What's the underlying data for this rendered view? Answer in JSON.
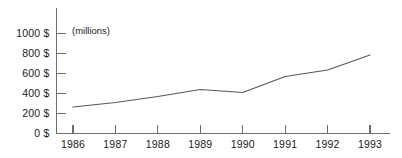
{
  "chart_data": {
    "type": "line",
    "title": "",
    "subtitle": "",
    "unit_note": "(millions)",
    "xlabel": "",
    "ylabel": "",
    "categories": [
      "1986",
      "1987",
      "1988",
      "1989",
      "1990",
      "1991",
      "1992",
      "1993"
    ],
    "x": [
      1986,
      1987,
      1988,
      1989,
      1990,
      1991,
      1992,
      1993
    ],
    "values": [
      265,
      310,
      370,
      440,
      410,
      570,
      635,
      785
    ],
    "series": [
      {
        "name": "",
        "values": [
          265,
          310,
          370,
          440,
          410,
          570,
          635,
          785
        ],
        "color": "#58585a"
      }
    ],
    "ylim": [
      0,
      1000
    ],
    "yticks": [
      0,
      200,
      400,
      600,
      800,
      1000
    ],
    "ytick_labels": [
      "0 $",
      "200 $",
      "400 $",
      "600 $",
      "800 $",
      "1000 $"
    ],
    "xtick_labels": [
      "1986",
      "1987",
      "1988",
      "1989",
      "1990",
      "1991",
      "1992",
      "1993"
    ],
    "grid": false,
    "legend": false,
    "legend_position": "none",
    "axis_color": "#6e6e6e",
    "line_color": "#58585a",
    "text_color": "#1a1a1a",
    "background": "#ffffff"
  },
  "axes": {
    "y_labels": [
      {
        "value": 1000,
        "text": "1000 $"
      },
      {
        "value": 800,
        "text": "800 $"
      },
      {
        "value": 600,
        "text": "600 $"
      },
      {
        "value": 400,
        "text": "400 $"
      },
      {
        "value": 200,
        "text": "200 $"
      },
      {
        "value": 0,
        "text": "0 $"
      }
    ],
    "x_labels": [
      {
        "value": 1986,
        "text": "1986"
      },
      {
        "value": 1987,
        "text": "1987"
      },
      {
        "value": 1988,
        "text": "1988"
      },
      {
        "value": 1989,
        "text": "1989"
      },
      {
        "value": 1990,
        "text": "1990"
      },
      {
        "value": 1991,
        "text": "1991"
      },
      {
        "value": 1992,
        "text": "1992"
      },
      {
        "value": 1993,
        "text": "1993"
      }
    ]
  },
  "annotations": {
    "unit_note": "(millions)"
  }
}
